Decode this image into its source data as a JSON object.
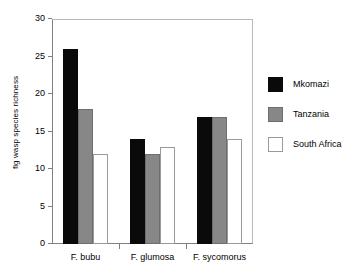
{
  "chart_data": {
    "type": "bar",
    "title": "",
    "xlabel": "",
    "ylabel": "fig wasp species richness",
    "categories": [
      "F. bubu",
      "F. glumosa",
      "F. sycomorus"
    ],
    "series": [
      {
        "name": "Mkomazi",
        "color": "#0a0a0a",
        "values": [
          26,
          14,
          17
        ]
      },
      {
        "name": "Tanzania",
        "color": "#878787",
        "values": [
          18,
          12,
          17
        ]
      },
      {
        "name": "South Africa",
        "color": "#ffffff",
        "values": [
          12,
          13,
          14
        ]
      }
    ],
    "ylim": [
      0,
      30
    ],
    "ytick_labels": [
      "0",
      "5",
      "10",
      "15",
      "20",
      "25",
      "30"
    ],
    "ytick_values": [
      0,
      5,
      10,
      15,
      20,
      25,
      30
    ],
    "grid": false,
    "legend_position": "right"
  }
}
